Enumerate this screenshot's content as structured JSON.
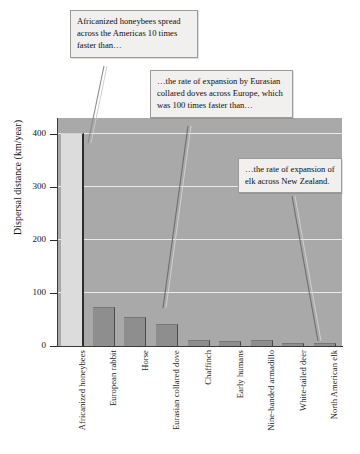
{
  "chart_data": {
    "type": "bar",
    "title": "",
    "xlabel": "",
    "ylabel": "Dispersal distance (km/year)",
    "ylim": [
      0,
      430
    ],
    "yticks": [
      0,
      100,
      200,
      300,
      400
    ],
    "ytick_labels": [
      "0",
      "100",
      "200",
      "300",
      "400"
    ],
    "grid": true,
    "legend": "none",
    "categories": [
      "Africanized honeybees",
      "European rabbit",
      "Horse",
      "Eurasian collared dove",
      "Chaffinch",
      "Early humans",
      "Nine-banded armadillo",
      "White-tailed deer",
      "North American elk"
    ],
    "values": [
      400,
      71,
      52,
      40,
      9,
      8,
      9,
      4,
      4
    ],
    "annotations": [
      "Africanized honeybees spread across the Americas 10 times faster than…",
      "…the rate of expansion by Eurasian collared doves across Europe, which was 100 times faster than…",
      "…the rate of expansion of elk across New Zealand."
    ]
  },
  "axis": {
    "y_title": "Dispersal distance (km/year)",
    "ticks": [
      {
        "label": "400",
        "value": 400
      },
      {
        "label": "300",
        "value": 300
      },
      {
        "label": "200",
        "value": 200
      },
      {
        "label": "100",
        "value": 100
      },
      {
        "label": "0",
        "value": 0
      }
    ]
  },
  "categories": [
    {
      "label": "Africanized honeybees",
      "value": 400
    },
    {
      "label": "European rabbit",
      "value": 71
    },
    {
      "label": "Horse",
      "value": 52
    },
    {
      "label": "Eurasian collared dove",
      "value": 40
    },
    {
      "label": "Chaffinch",
      "value": 9
    },
    {
      "label": "Early humans",
      "value": 8
    },
    {
      "label": "Nine-banded armadillo",
      "value": 9
    },
    {
      "label": "White-tailed deer",
      "value": 4
    },
    {
      "label": "North American elk",
      "value": 4
    }
  ],
  "callouts": [
    {
      "id": "callout-1",
      "text": "Africanized honeybees spread across the Americas 10 times faster than…"
    },
    {
      "id": "callout-2",
      "text": "…the rate of expansion by Eurasian collared doves across Europe, which was 100 times faster than…"
    },
    {
      "id": "callout-3",
      "text": "…the rate of expansion of elk across New Zealand."
    }
  ],
  "colors": {
    "plot_background": "#a9a9a9",
    "gridline": "#eceaea",
    "bar": "#8e8e8e",
    "bar_highlight": "#dcdcdc",
    "axis": "#2b2b2b",
    "callout_background": "#f2f0ee",
    "callout_border": "#9b9b9b",
    "page_background": "#ffffff"
  }
}
